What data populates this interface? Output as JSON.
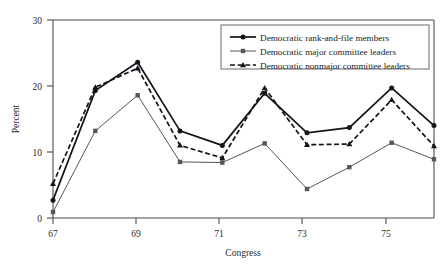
{
  "chart_data": {
    "type": "line",
    "title": "",
    "xlabel": "Congress",
    "ylabel": "Percent",
    "x": [
      67,
      68,
      69,
      70,
      71,
      72,
      73,
      74,
      75,
      76
    ],
    "xlim": [
      67,
      76
    ],
    "ylim": [
      0,
      30
    ],
    "xticks": [
      67,
      69,
      71,
      73,
      75
    ],
    "xticklabels": [
      "67",
      "69",
      "71",
      "73",
      "75"
    ],
    "yticks": [
      0,
      10,
      20,
      30
    ],
    "yticklabels": [
      "0",
      "10",
      "20",
      "30"
    ],
    "grid": false,
    "legend_position": "top-right",
    "series": [
      {
        "name": "Democratic rank-and-file members",
        "marker": "circle",
        "linestyle": "solid",
        "color": "#14141a",
        "values": [
          2.7,
          19.3,
          23.6,
          13.2,
          11.0,
          18.9,
          12.9,
          13.7,
          19.7,
          14.0
        ]
      },
      {
        "name": "Democratic major committee leaders",
        "marker": "square",
        "linestyle": "solid-thin",
        "color": "#55555e",
        "values": [
          0.9,
          13.2,
          18.6,
          8.5,
          8.4,
          11.3,
          4.4,
          7.7,
          11.4,
          8.9
        ]
      },
      {
        "name": "Democratic nonmajor committee leaders",
        "marker": "triangle",
        "linestyle": "dashed",
        "color": "#14141a",
        "values": [
          5.2,
          19.8,
          22.7,
          11.0,
          9.1,
          19.7,
          11.1,
          11.2,
          17.9,
          10.9
        ]
      }
    ]
  },
  "axes": {
    "y_title": "Percent",
    "x_title": "Congress",
    "y_tick_0": "0",
    "y_tick_10": "10",
    "y_tick_20": "20",
    "y_tick_30": "30",
    "x_tick_67": "67",
    "x_tick_69": "69",
    "x_tick_71": "71",
    "x_tick_73": "73",
    "x_tick_75": "75"
  },
  "legend": {
    "items": [
      {
        "label": "Democratic rank-and-file members"
      },
      {
        "label": "Democratic major committee leaders"
      },
      {
        "label": "Democratic nonmajor committee leaders"
      }
    ]
  }
}
